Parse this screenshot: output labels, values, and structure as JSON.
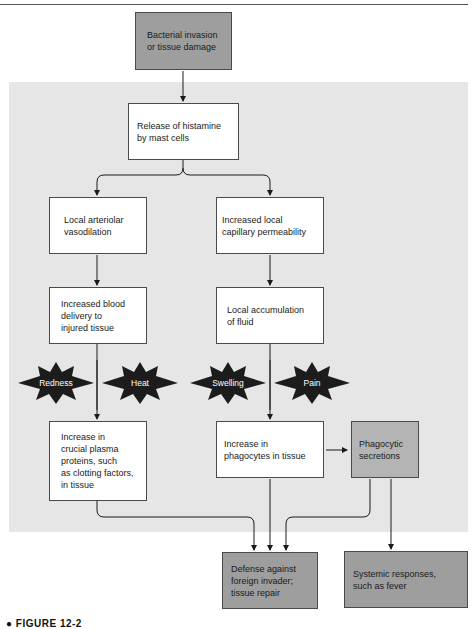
{
  "diagram": {
    "type": "flowchart",
    "colors": {
      "panel": "#e6e6e6",
      "box_light": "#ffffff",
      "box_dark": "#9e9e9e",
      "box_mid": "#b4b4b4",
      "starburst": "#1c1c1c",
      "line": "#1a1a1a"
    },
    "nodes": {
      "trigger": "Bacterial invasion\nor tissue damage",
      "histamine": "Release of histamine\nby mast cells",
      "vasodilation": "Local arteriolar\nvasodilation",
      "permeability": "Increased local\ncapillary permeability",
      "blood_delivery": "Increased blood\ndelivery to\ninjured tissue",
      "fluid": "Local accumulation\nof fluid",
      "plasma_proteins": "Increase in\ncrucial plasma\nproteins, such\nas clotting factors,\nin tissue",
      "phagocytes": "Increase in\nphagocytes in tissue",
      "secretions": "Phagocytic\nsecretions",
      "defense": "Defense against\nforeign invader;\ntissue repair",
      "systemic": "Systemic responses,\nsuch as fever"
    },
    "signs": [
      "Redness",
      "Heat",
      "Swelling",
      "Pain"
    ],
    "edges": [
      [
        "trigger",
        "histamine"
      ],
      [
        "histamine",
        "vasodilation"
      ],
      [
        "histamine",
        "permeability"
      ],
      [
        "vasodilation",
        "blood_delivery"
      ],
      [
        "permeability",
        "fluid"
      ],
      [
        "blood_delivery",
        "plasma_proteins"
      ],
      [
        "fluid",
        "phagocytes"
      ],
      [
        "phagocytes",
        "secretions"
      ],
      [
        "plasma_proteins",
        "defense"
      ],
      [
        "phagocytes",
        "defense"
      ],
      [
        "secretions",
        "defense"
      ],
      [
        "secretions",
        "systemic"
      ]
    ]
  },
  "caption": "● FIGURE 12-2"
}
